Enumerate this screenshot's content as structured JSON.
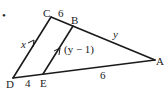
{
  "diagram": {
    "type": "triangle-with-parallel-segment",
    "bullet": "•",
    "points": {
      "A": {
        "label": "A",
        "x": 155,
        "y": 60
      },
      "B": {
        "label": "B",
        "x": 73,
        "y": 26
      },
      "C": {
        "label": "C",
        "x": 51,
        "y": 17
      },
      "D": {
        "label": "D",
        "x": 13,
        "y": 78
      },
      "E": {
        "label": "E",
        "x": 43,
        "y": 74
      }
    },
    "segments": [
      {
        "from": "C",
        "to": "B",
        "length_label": "6"
      },
      {
        "from": "B",
        "to": "A",
        "length_label": "y"
      },
      {
        "from": "C",
        "to": "D",
        "length_label": "x",
        "parallel_mark": true
      },
      {
        "from": "B",
        "to": "E",
        "length_label": "(y − 1)",
        "parallel_mark": true
      },
      {
        "from": "D",
        "to": "E",
        "length_label": "4"
      },
      {
        "from": "E",
        "to": "A",
        "length_label": "6"
      }
    ],
    "labels": {
      "CB": "6",
      "BA": "y",
      "CD": "x",
      "BE": "(y − 1)",
      "DE": "4",
      "EA": "6"
    },
    "colors": {
      "line": "#1a1a1a",
      "text": "#222222",
      "background": "#ffffff"
    }
  }
}
